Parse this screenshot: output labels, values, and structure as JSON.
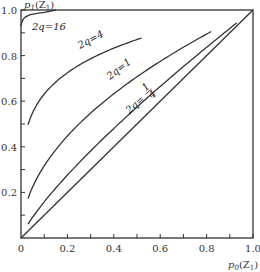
{
  "chart_data": {
    "type": "line",
    "title": "",
    "xlabel": "p₀(Z₁)",
    "ylabel": "p₁(Z₁)",
    "xlim": [
      0,
      1.0
    ],
    "ylim": [
      0,
      1.0
    ],
    "grid": false,
    "legend": "inline curve labels",
    "x_ticks": [
      "0",
      "0.2",
      "0.4",
      "0.6",
      "0.8",
      "1.0"
    ],
    "y_ticks": [
      "0.2",
      "0.4",
      "0.6",
      "0.8",
      "1.0"
    ],
    "series": [
      {
        "name": "2q=16",
        "label": "2q=16",
        "exponent": 0.0588,
        "x_range": [
          0.0,
          0.15
        ],
        "x": [
          0.0,
          0.002,
          0.005,
          0.01,
          0.02,
          0.04,
          0.07,
          0.1,
          0.15
        ],
        "y": [
          0.93,
          0.94,
          0.95,
          0.96,
          0.97,
          0.98,
          0.985,
          0.99,
          1.0
        ]
      },
      {
        "name": "2q=4",
        "label": "2q=4",
        "exponent": 0.2,
        "x_range": [
          0.03,
          0.52
        ],
        "x": [
          0.03,
          0.05,
          0.1,
          0.15,
          0.2,
          0.3,
          0.4,
          0.52
        ],
        "y": [
          0.53,
          0.62,
          0.72,
          0.77,
          0.81,
          0.87,
          0.91,
          0.97
        ]
      },
      {
        "name": "2q=1",
        "label": "2q=1",
        "exponent": 0.5,
        "x_range": [
          0.03,
          0.82
        ],
        "x": [
          0.03,
          0.1,
          0.2,
          0.3,
          0.4,
          0.5,
          0.6,
          0.7,
          0.82
        ],
        "y": [
          0.18,
          0.32,
          0.45,
          0.55,
          0.63,
          0.71,
          0.77,
          0.84,
          0.97
        ]
      },
      {
        "name": "2q=1/4",
        "label": "2q=1/4",
        "exponent": 0.8,
        "x_range": [
          0.03,
          0.93
        ],
        "x": [
          0.03,
          0.1,
          0.2,
          0.3,
          0.4,
          0.5,
          0.6,
          0.7,
          0.8,
          0.93
        ],
        "y": [
          0.08,
          0.16,
          0.28,
          0.38,
          0.48,
          0.57,
          0.66,
          0.75,
          0.84,
          0.97
        ]
      },
      {
        "name": "diagonal",
        "label": "",
        "exponent": 1.0,
        "x_range": [
          0,
          1
        ],
        "x": [
          0,
          1
        ],
        "y": [
          0,
          1
        ]
      }
    ],
    "annotations": [
      "2q=16",
      "2q=4",
      "2q=1",
      "2q=1/4"
    ]
  },
  "labels": {
    "y_axis_title_main": "p",
    "y_axis_title_sub": "1",
    "y_axis_title_arg": "(Z",
    "y_axis_title_arg_sub": "1",
    "y_axis_title_close": ")",
    "x_axis_title_main": "p",
    "x_axis_title_sub": "0",
    "x_axis_title_arg": "(Z",
    "x_axis_title_arg_sub": "1",
    "x_axis_title_close": ")",
    "curve_16": "2q=16",
    "curve_4": "2q=4",
    "curve_1": "2q=1",
    "curve_quarter_prefix": "2q=",
    "curve_quarter_num": "1",
    "curve_quarter_den": "4"
  }
}
